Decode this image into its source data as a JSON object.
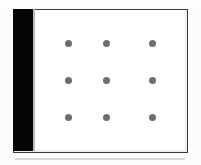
{
  "document": {
    "kind": "scanned-figure-plate",
    "caption": "",
    "title": ""
  },
  "colors": {
    "page_background": "#fdfdfd",
    "panel_background": "#ffffff",
    "panel_border": "#3a3a3a",
    "gutter_bar": "#050505",
    "gutter_edge": "#b9b9b9",
    "dot": "#6e6e6e",
    "baseline_rule": "#d8d8d8"
  },
  "figure": {
    "label": "Nine-dot grid figure",
    "panel": {
      "name": "figure plate",
      "x": 13,
      "y": 9,
      "width": 175,
      "height": 144
    },
    "gutter": {
      "name": "black gutter bar",
      "x": 13,
      "y": 9,
      "width": 20,
      "height": 142
    },
    "grid": {
      "rows": 3,
      "columns": 3,
      "dot_count": 9,
      "dot_diameter": 7,
      "dot_color": "#6e6e6e",
      "row_labels": [
        "row 1",
        "row 2",
        "row 3"
      ],
      "column_labels": [
        "column 1",
        "column 2",
        "column 3"
      ],
      "dots": [
        {
          "row": 0,
          "col": 0,
          "cx": 68,
          "cy": 43
        },
        {
          "row": 0,
          "col": 1,
          "cx": 106,
          "cy": 43
        },
        {
          "row": 0,
          "col": 2,
          "cx": 152,
          "cy": 43
        },
        {
          "row": 1,
          "col": 0,
          "cx": 68,
          "cy": 80
        },
        {
          "row": 1,
          "col": 1,
          "cx": 106,
          "cy": 80
        },
        {
          "row": 1,
          "col": 2,
          "cx": 152,
          "cy": 80
        },
        {
          "row": 2,
          "col": 0,
          "cx": 68,
          "cy": 117
        },
        {
          "row": 2,
          "col": 1,
          "cx": 106,
          "cy": 117
        },
        {
          "row": 2,
          "col": 2,
          "cx": 152,
          "cy": 117
        }
      ]
    },
    "baseline_rule": {
      "name": "horizontal rule",
      "x": 15,
      "y": 158,
      "width": 170,
      "height": 2
    }
  }
}
